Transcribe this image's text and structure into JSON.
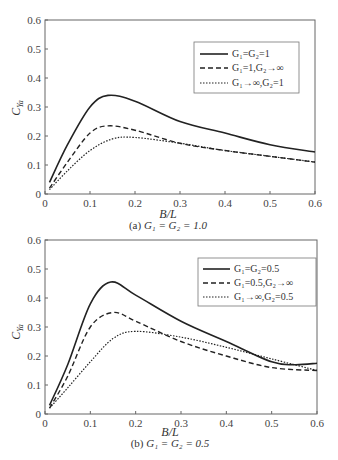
{
  "chart_data": [
    {
      "type": "line",
      "title": "",
      "caption": "(a) G1 = G2 = 1.0",
      "caption_prefix": "(a)",
      "caption_eq": "G₁ = G₂ = 1.0",
      "xlabel": "B/L",
      "ylabel": "C_Ya",
      "xlim": [
        0,
        0.6
      ],
      "ylim": [
        0,
        0.6
      ],
      "xticks": [
        "0",
        "0.1",
        "0.2",
        "0.3",
        "0.4",
        "0.5",
        "0.6"
      ],
      "yticks": [
        "0",
        "0.1",
        "0.2",
        "0.3",
        "0.4",
        "0.5",
        "0.6"
      ],
      "grid": false,
      "legend_position": "upper right",
      "series": [
        {
          "name": "G1=G2=1",
          "label": "G₁=G₂=1",
          "style": "solid",
          "x": [
            0.01,
            0.05,
            0.1,
            0.14,
            0.2,
            0.3,
            0.4,
            0.5,
            0.6
          ],
          "y": [
            0.04,
            0.17,
            0.3,
            0.34,
            0.32,
            0.25,
            0.21,
            0.17,
            0.145
          ]
        },
        {
          "name": "G1=1,G2→∞",
          "label": "G₁=1,G₂→∞",
          "style": "dashed",
          "x": [
            0.01,
            0.05,
            0.1,
            0.14,
            0.2,
            0.3,
            0.4,
            0.5,
            0.6
          ],
          "y": [
            0.02,
            0.11,
            0.21,
            0.235,
            0.22,
            0.175,
            0.15,
            0.13,
            0.11
          ]
        },
        {
          "name": "G1→∞,G2=1",
          "label": "G₁→∞,G₂=1",
          "style": "dotted",
          "x": [
            0.01,
            0.05,
            0.1,
            0.15,
            0.2,
            0.3,
            0.4,
            0.5,
            0.6
          ],
          "y": [
            0.015,
            0.08,
            0.15,
            0.19,
            0.195,
            0.175,
            0.15,
            0.13,
            0.11
          ]
        }
      ]
    },
    {
      "type": "line",
      "title": "",
      "caption": "(b) G1 = G2 = 0.5",
      "caption_prefix": "(b)",
      "caption_eq": "G₁ = G₂ = 0.5",
      "xlabel": "B/L",
      "ylabel": "C_Ya",
      "xlim": [
        0,
        0.6
      ],
      "ylim": [
        0,
        0.6
      ],
      "xticks": [
        "0",
        "0.1",
        "0.2",
        "0.3",
        "0.4",
        "0.5",
        "0.6"
      ],
      "yticks": [
        "0",
        "0.1",
        "0.2",
        "0.3",
        "0.4",
        "0.5",
        "0.6"
      ],
      "grid": false,
      "legend_position": "upper right",
      "series": [
        {
          "name": "G1=G2=0.5",
          "label": "G₁=G₂=0.5",
          "style": "solid",
          "x": [
            0.01,
            0.05,
            0.1,
            0.145,
            0.2,
            0.3,
            0.4,
            0.5,
            0.55,
            0.6
          ],
          "y": [
            0.03,
            0.17,
            0.38,
            0.455,
            0.41,
            0.32,
            0.25,
            0.18,
            0.17,
            0.175
          ]
        },
        {
          "name": "G1=0.5,G2→∞",
          "label": "G₁=0.5,G₂→∞",
          "style": "dashed",
          "x": [
            0.01,
            0.05,
            0.1,
            0.15,
            0.2,
            0.3,
            0.4,
            0.5,
            0.6
          ],
          "y": [
            0.02,
            0.13,
            0.3,
            0.35,
            0.32,
            0.25,
            0.2,
            0.16,
            0.15
          ]
        },
        {
          "name": "G1→∞,G2=0.5",
          "label": "G₁→∞,G₂=0.5",
          "style": "dotted",
          "x": [
            0.01,
            0.05,
            0.1,
            0.15,
            0.2,
            0.3,
            0.4,
            0.5,
            0.6
          ],
          "y": [
            0.02,
            0.09,
            0.18,
            0.26,
            0.285,
            0.265,
            0.23,
            0.19,
            0.15
          ]
        }
      ]
    }
  ]
}
